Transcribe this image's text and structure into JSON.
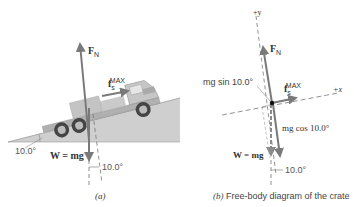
{
  "panel_a": {
    "caption": "(a)",
    "labels": {
      "normal_force": {
        "symbol": "F",
        "subscript": "N"
      },
      "friction": {
        "symbol": "f",
        "subscript": "s",
        "superscript": "MAX"
      },
      "weight": "W = mg",
      "incline_angle": "10.0°",
      "weight_angle": "10.0°"
    }
  },
  "panel_b": {
    "caption_label": "(b)",
    "caption_text": " Free-body diagram of the crate",
    "labels": {
      "y_axis": "+y",
      "x_axis": "+x",
      "normal_force": {
        "symbol": "F",
        "subscript": "N"
      },
      "friction": {
        "symbol": "f",
        "subscript": "s",
        "superscript": "MAX"
      },
      "parallel_component": "mg sin 10.0°",
      "perpendicular_component": "mg cos 10.0°",
      "weight": "W = mg",
      "angle": "10.0°"
    }
  },
  "colors": {
    "arrow": "#7a7a7a",
    "incline": "#c8c8c8",
    "truck_body": "#bdbdbd",
    "truck_dark": "#555555",
    "text": "#333333"
  }
}
